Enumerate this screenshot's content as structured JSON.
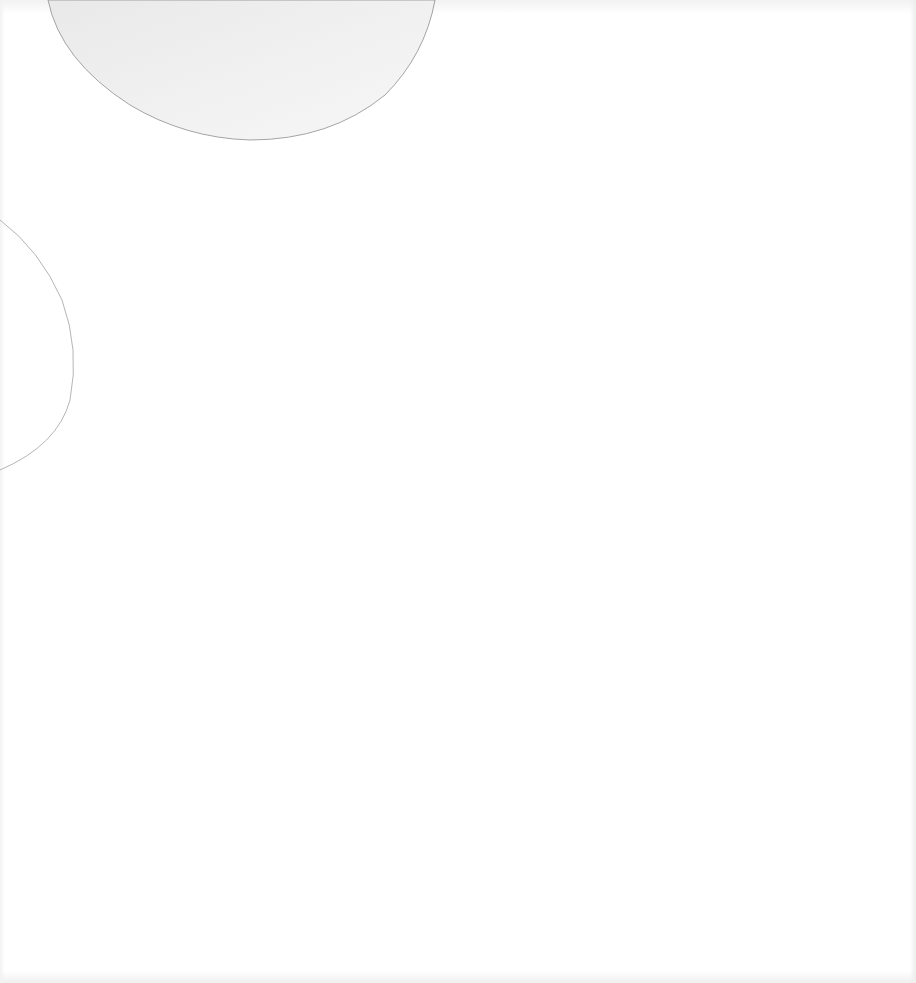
{
  "page": {
    "background": "#ffffff",
    "shapes": {
      "top_semicircle": {
        "fill": "#eeeeee",
        "stroke": "#8a8a8a"
      },
      "left_arc": {
        "stroke": "#9a9a9a"
      }
    }
  }
}
